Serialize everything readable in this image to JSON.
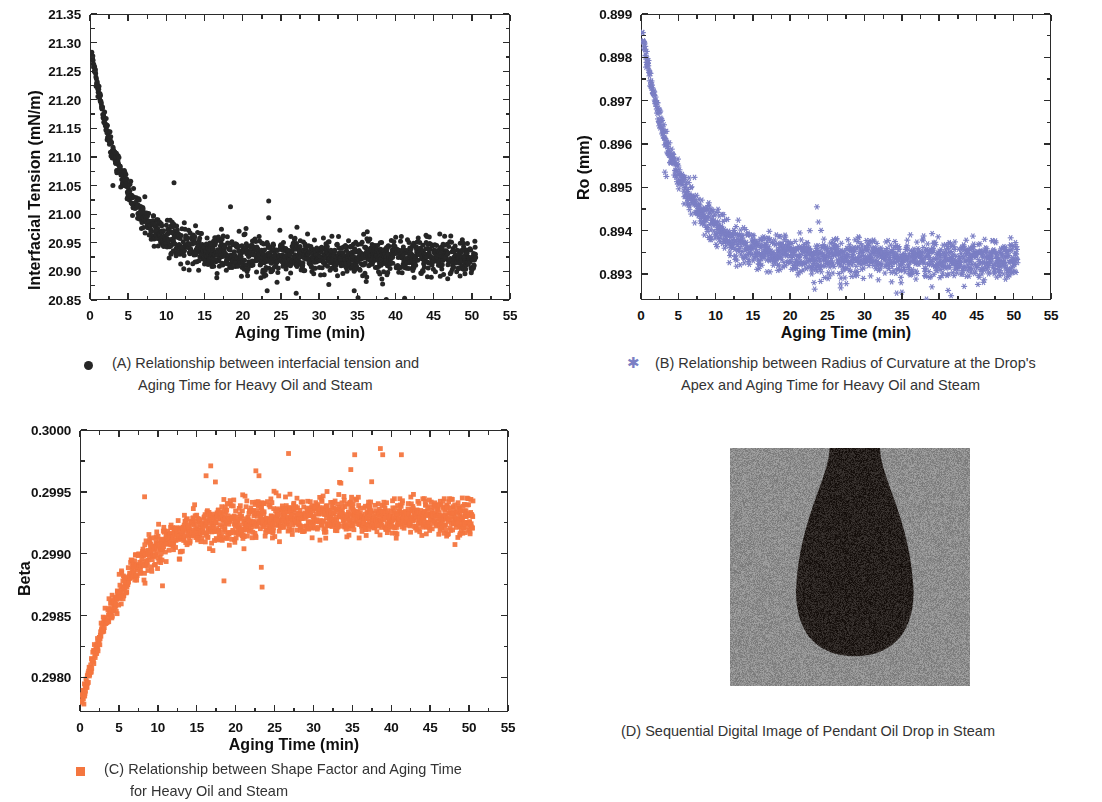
{
  "figure": {
    "panels": [
      "A",
      "B",
      "C",
      "D"
    ]
  },
  "panelA": {
    "caption_lines": [
      "(A) Relationship between interfacial tension and",
      "Aging Time for Heavy Oil and Steam"
    ],
    "legend_marker": "filled-circle",
    "marker_color": "#262626",
    "chart_data": {
      "type": "scatter",
      "title": "",
      "xlabel": "Aging Time (min)",
      "ylabel": "Interfacial Tension (mN/m)",
      "xlim": [
        0,
        55
      ],
      "ylim": [
        20.85,
        21.35
      ],
      "xticks": [
        0,
        5,
        10,
        15,
        20,
        25,
        30,
        35,
        40,
        45,
        50,
        55
      ],
      "ytick_labels": [
        "20.85",
        "20.90",
        "20.95",
        "21.00",
        "21.05",
        "21.10",
        "21.15",
        "21.20",
        "21.25",
        "21.30",
        "21.35"
      ],
      "yticks": [
        20.85,
        20.9,
        20.95,
        21.0,
        21.05,
        21.1,
        21.15,
        21.2,
        21.25,
        21.3,
        21.35
      ],
      "grid": false,
      "legend_position": "below-plot",
      "series": [
        {
          "name": "Interfacial tension",
          "color": "#262626",
          "marker": "circle",
          "model": "exponential-decay",
          "y_start": 21.3,
          "y_plateau": 20.925,
          "decay_tau": 4.2,
          "noise": 0.012,
          "x_start": 0.2,
          "x_end": 50.5,
          "n_points": 1500,
          "outliers": [
            {
              "x": 3.0,
              "y": 21.05
            },
            {
              "x": 8.4,
              "y": 20.944
            },
            {
              "x": 8.6,
              "y": 20.972
            },
            {
              "x": 10.7,
              "y": 20.968
            },
            {
              "x": 11.0,
              "y": 21.055
            },
            {
              "x": 16.6,
              "y": 20.889
            },
            {
              "x": 18.4,
              "y": 21.013
            },
            {
              "x": 18.6,
              "y": 20.907
            },
            {
              "x": 23.2,
              "y": 20.866
            },
            {
              "x": 23.4,
              "y": 21.023
            },
            {
              "x": 23.4,
              "y": 20.994
            },
            {
              "x": 27.0,
              "y": 20.862
            },
            {
              "x": 27.1,
              "y": 20.977
            },
            {
              "x": 34.6,
              "y": 20.866
            },
            {
              "x": 35.1,
              "y": 20.854
            },
            {
              "x": 38.8,
              "y": 20.851
            },
            {
              "x": 41.2,
              "y": 20.853
            },
            {
              "x": 44.0,
              "y": 20.963
            },
            {
              "x": 49.1,
              "y": 20.896
            }
          ]
        }
      ]
    }
  },
  "panelB": {
    "caption_lines": [
      "(B) Relationship between Radius of Curvature at the Drop's",
      "Apex and Aging Time for Heavy Oil and Steam"
    ],
    "legend_marker": "star",
    "marker_color": "#7b7fc4",
    "chart_data": {
      "type": "scatter",
      "title": "",
      "xlabel": "Aging Time (min)",
      "ylabel": "Ro (mm)",
      "xlim": [
        0,
        55
      ],
      "ylim": [
        0.8924,
        0.899
      ],
      "xticks": [
        0,
        5,
        10,
        15,
        20,
        25,
        30,
        35,
        40,
        45,
        50,
        55
      ],
      "ytick_labels": [
        "0.893",
        "0.894",
        "0.895",
        "0.896",
        "0.897",
        "0.898",
        "0.899"
      ],
      "yticks": [
        0.893,
        0.894,
        0.895,
        0.896,
        0.897,
        0.898,
        0.899
      ],
      "grid": false,
      "legend_position": "below-plot",
      "series": [
        {
          "name": "Radius of curvature at drop apex",
          "color": "#7b7fc4",
          "marker": "star",
          "model": "exponential-decay",
          "y_start": 0.8987,
          "y_plateau": 0.89335,
          "decay_tau": 5.0,
          "noise": 0.00016,
          "x_start": 0.2,
          "x_end": 50.5,
          "n_points": 1500,
          "outliers": [
            {
              "x": 3.2,
              "y": 0.89535
            },
            {
              "x": 3.4,
              "y": 0.89525
            },
            {
              "x": 7.2,
              "y": 0.89418
            },
            {
              "x": 8.2,
              "y": 0.89432
            },
            {
              "x": 8.5,
              "y": 0.8939
            },
            {
              "x": 10.8,
              "y": 0.8941
            },
            {
              "x": 16.9,
              "y": 0.89305
            },
            {
              "x": 17.8,
              "y": 0.8933
            },
            {
              "x": 18.6,
              "y": 0.8934
            },
            {
              "x": 22.9,
              "y": 0.893
            },
            {
              "x": 23.2,
              "y": 0.8928
            },
            {
              "x": 23.3,
              "y": 0.89265
            },
            {
              "x": 23.6,
              "y": 0.89455
            },
            {
              "x": 23.8,
              "y": 0.8942
            },
            {
              "x": 26.8,
              "y": 0.89268
            },
            {
              "x": 27.0,
              "y": 0.89305
            },
            {
              "x": 34.3,
              "y": 0.89256
            },
            {
              "x": 35.0,
              "y": 0.89258
            },
            {
              "x": 38.3,
              "y": 0.89242
            },
            {
              "x": 41.2,
              "y": 0.89262
            },
            {
              "x": 41.6,
              "y": 0.8925
            },
            {
              "x": 44.0,
              "y": 0.89295
            },
            {
              "x": 48.9,
              "y": 0.89288
            }
          ]
        }
      ]
    }
  },
  "panelC": {
    "caption_lines": [
      "(C) Relationship between Shape Factor and Aging Time",
      "for Heavy Oil and Steam"
    ],
    "legend_marker": "open-square",
    "marker_color": "#f4763f",
    "chart_data": {
      "type": "scatter",
      "title": "",
      "xlabel": "Aging Time (min)",
      "ylabel": "Beta",
      "xlim": [
        0,
        55
      ],
      "ylim": [
        0.29772,
        0.3
      ],
      "xticks": [
        0,
        5,
        10,
        15,
        20,
        25,
        30,
        35,
        40,
        45,
        50,
        55
      ],
      "ytick_labels": [
        "0.2980",
        "0.2985",
        "0.2990",
        "0.2995",
        "0.3000"
      ],
      "yticks": [
        0.298,
        0.2985,
        0.299,
        0.2995,
        0.3
      ],
      "grid": false,
      "legend_position": "below-plot",
      "series": [
        {
          "name": "Shape factor Beta",
          "color": "#f4763f",
          "marker": "square",
          "model": "exponential-rise",
          "y_start": 0.29775,
          "y_plateau": 0.2993,
          "decay_tau": 5.5,
          "noise": 6e-05,
          "x_start": 0.2,
          "x_end": 50.5,
          "n_points": 1500,
          "outliers": [
            {
              "x": 8.3,
              "y": 0.29946
            },
            {
              "x": 10.6,
              "y": 0.29874
            },
            {
              "x": 16.2,
              "y": 0.29963
            },
            {
              "x": 16.8,
              "y": 0.29971
            },
            {
              "x": 17.4,
              "y": 0.29958
            },
            {
              "x": 18.5,
              "y": 0.29878
            },
            {
              "x": 22.6,
              "y": 0.29967
            },
            {
              "x": 23.0,
              "y": 0.29963
            },
            {
              "x": 23.3,
              "y": 0.29889
            },
            {
              "x": 23.4,
              "y": 0.29873
            },
            {
              "x": 26.8,
              "y": 0.29981
            },
            {
              "x": 34.8,
              "y": 0.29968
            },
            {
              "x": 35.3,
              "y": 0.2998
            },
            {
              "x": 38.6,
              "y": 0.29985
            },
            {
              "x": 38.9,
              "y": 0.2998
            },
            {
              "x": 41.3,
              "y": 0.2998
            },
            {
              "x": 44.5,
              "y": 0.29916
            },
            {
              "x": 48.8,
              "y": 0.29915
            }
          ]
        }
      ]
    }
  },
  "panelD": {
    "caption": "(D) Sequential Digital Image of Pendant Oil Drop in Steam",
    "image": {
      "kind": "pendant-oil-drop-photo",
      "background_color": "#8d8d8d",
      "drop_color": "#26201d"
    }
  }
}
